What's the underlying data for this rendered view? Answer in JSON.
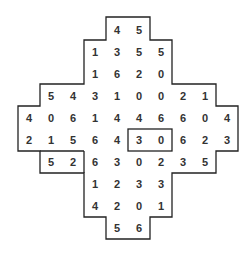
{
  "puzzle": {
    "cell_size": 22,
    "origin": {
      "x": 18,
      "y": 19
    },
    "line_color": "#222222",
    "text_color": "#333333",
    "rows": [
      {
        "row": 0,
        "start_col": 4,
        "values": [
          "4",
          "5"
        ]
      },
      {
        "row": 1,
        "start_col": 3,
        "values": [
          "1",
          "3",
          "5",
          "5"
        ]
      },
      {
        "row": 2,
        "start_col": 3,
        "values": [
          "1",
          "6",
          "2",
          "0"
        ]
      },
      {
        "row": 3,
        "start_col": 1,
        "values": [
          "5",
          "4",
          "3",
          "1",
          "0",
          "0",
          "2",
          "1"
        ]
      },
      {
        "row": 4,
        "start_col": 0,
        "values": [
          "4",
          "0",
          "6",
          "1",
          "4",
          "4",
          "6",
          "6",
          "0",
          "4"
        ]
      },
      {
        "row": 5,
        "start_col": 0,
        "values": [
          "2",
          "1",
          "5",
          "6",
          "4",
          "3",
          "0",
          "6",
          "2",
          "3"
        ]
      },
      {
        "row": 6,
        "start_col": 1,
        "values": [
          "5",
          "2",
          "6",
          "3",
          "0",
          "2",
          "3",
          "5"
        ]
      },
      {
        "row": 7,
        "start_col": 3,
        "values": [
          "1",
          "2",
          "3",
          "3"
        ]
      },
      {
        "row": 8,
        "start_col": 3,
        "values": [
          "4",
          "2",
          "0",
          "1"
        ]
      },
      {
        "row": 9,
        "start_col": 4,
        "values": [
          "5",
          "6"
        ]
      }
    ],
    "inner_boxes": [
      {
        "name": "box-3-0",
        "row": 5,
        "col": 5,
        "width_cells": 2,
        "height_cells": 1
      },
      {
        "name": "box-5-2",
        "row": 6,
        "col": 1,
        "width_cells": 2,
        "height_cells": 1
      }
    ]
  }
}
